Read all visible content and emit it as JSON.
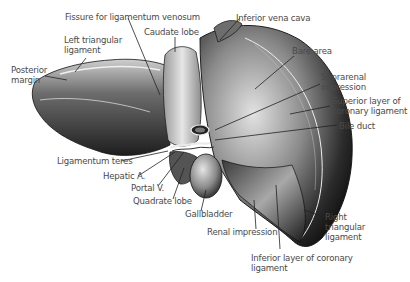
{
  "figure": {
    "colors": {
      "background": "#ffffff",
      "text": "#4a4a4a",
      "leader": "#222222",
      "organ_dark": "#1a1a1a",
      "organ_light": "#bdbdbd"
    }
  },
  "labels": [
    {
      "id": "fissure",
      "text": "Fissure for ligamentum venosum",
      "x": 65,
      "y": 12
    },
    {
      "id": "ivc",
      "text": "Inferior vena cava",
      "x": 236,
      "y": 13
    },
    {
      "id": "caudate",
      "text": "Caudate lobe",
      "x": 144,
      "y": 27
    },
    {
      "id": "left_tri",
      "text": "Left triangular\nligament",
      "x": 64,
      "y": 35
    },
    {
      "id": "posterior",
      "text": "Posterior\nmargin",
      "x": 11,
      "y": 65
    },
    {
      "id": "bare",
      "text": "Bare area",
      "x": 292,
      "y": 46
    },
    {
      "id": "suprarenal",
      "text": "Suprarenal\nimpression",
      "x": 321,
      "y": 72
    },
    {
      "id": "sup_coronary",
      "text": "Superior layer of\ncoronary ligament",
      "x": 332,
      "y": 96
    },
    {
      "id": "bile",
      "text": "Bile duct",
      "x": 339,
      "y": 121
    },
    {
      "id": "teres",
      "text": "Ligamentum teres",
      "x": 57,
      "y": 156
    },
    {
      "id": "hepatic",
      "text": "Hepatic A.",
      "x": 103,
      "y": 171
    },
    {
      "id": "portal",
      "text": "Portal V.",
      "x": 131,
      "y": 183
    },
    {
      "id": "quadrate",
      "text": "Quadrate lobe",
      "x": 133,
      "y": 196
    },
    {
      "id": "gallbladder",
      "text": "Gallbladder",
      "x": 185,
      "y": 209
    },
    {
      "id": "renal",
      "text": "Renal impression",
      "x": 207,
      "y": 227
    },
    {
      "id": "right_tri",
      "text": "Right\ntriangular\nligament",
      "x": 325,
      "y": 212
    },
    {
      "id": "inf_coronary",
      "text": "Inferior layer of coronary\nligament",
      "x": 251,
      "y": 253
    }
  ]
}
